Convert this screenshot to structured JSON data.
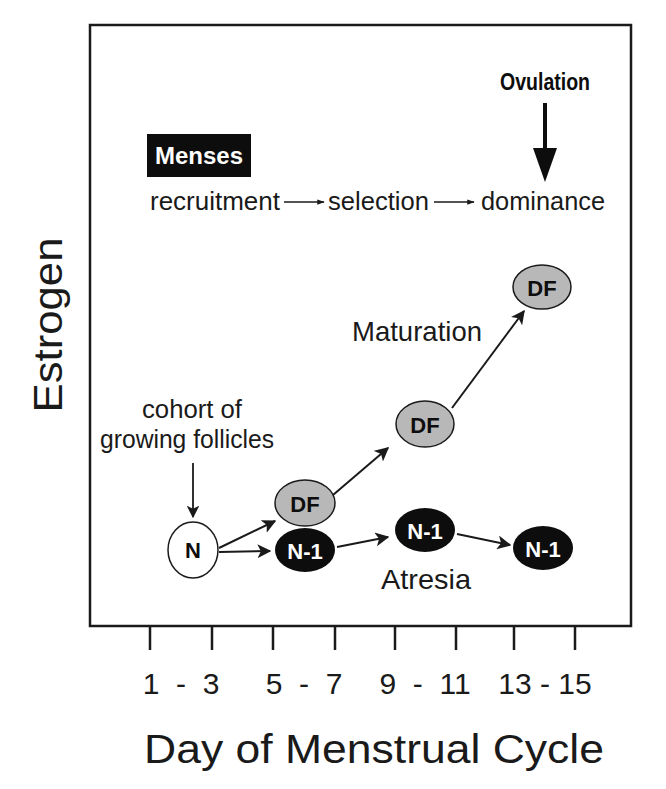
{
  "title_markers": {
    "menses": "Menses",
    "ovulation": "Ovulation"
  },
  "stages": {
    "recruitment": "recruitment",
    "selection": "selection",
    "dominance": "dominance"
  },
  "annotations": {
    "cohort_line1": "cohort of",
    "cohort_line2": "growing follicles",
    "maturation": "Maturation",
    "atresia": "Atresia"
  },
  "axes": {
    "ylabel": "Estrogen",
    "xlabel": "Day of Menstrual Cycle",
    "x_ticks": [
      "1  -  3",
      "5  -  7",
      "9  -  11",
      "13 - 15"
    ]
  },
  "nodes": [
    {
      "id": "n0",
      "label": "N",
      "style": "white",
      "cx": 193,
      "cy": 550
    },
    {
      "id": "df1",
      "label": "DF",
      "style": "gray",
      "cx": 305,
      "cy": 503
    },
    {
      "id": "n1a",
      "label": "N-1",
      "style": "black",
      "cx": 305,
      "cy": 550
    },
    {
      "id": "df2",
      "label": "DF",
      "style": "gray",
      "cx": 425,
      "cy": 424
    },
    {
      "id": "n1b",
      "label": "N-1",
      "style": "black",
      "cx": 425,
      "cy": 530
    },
    {
      "id": "df3",
      "label": "DF",
      "style": "gray",
      "cx": 542,
      "cy": 287
    },
    {
      "id": "n1c",
      "label": "N-1",
      "style": "black",
      "cx": 543,
      "cy": 548
    }
  ],
  "colors": {
    "frame": "#1a1a1a",
    "gray_node": "#b8b8b8",
    "black_node": "#0d0d0d",
    "white_node": "#ffffff"
  }
}
